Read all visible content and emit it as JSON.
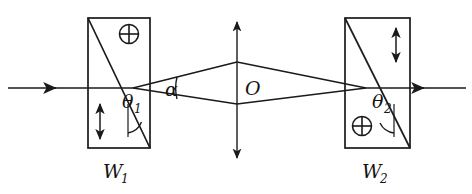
{
  "figure": {
    "background_color": "#ffffff",
    "ink_color": "#1a1a1a",
    "width": 472,
    "height": 194
  },
  "labels": {
    "wedge_left_name": "W",
    "wedge_left_index": "1",
    "wedge_right_name": "W",
    "wedge_right_index": "2",
    "theta_left_symbol": "θ",
    "theta_left_index": "1",
    "theta_right_symbol": "θ",
    "theta_right_index": "2",
    "alpha_symbol": "α",
    "center_point": "O"
  },
  "elements": {
    "wedge_left": {
      "name": "W1",
      "marker_top_right": "circled-plus",
      "marker_bottom_left": "vertical-double-arrow",
      "diagonal": "top-left-to-bottom-right",
      "angle_label": "θ1"
    },
    "wedge_right": {
      "name": "W2",
      "marker_top_right": "vertical-double-arrow",
      "marker_bottom_left": "circled-plus",
      "diagonal": "top-left-to-bottom-right",
      "angle_label": "θ2"
    },
    "center_axis": {
      "name": "O",
      "style": "vertical-double-headed-arrow"
    },
    "input_ray": {
      "direction": "rightward",
      "style": "horizontal-with-arrowhead"
    },
    "output_ray": {
      "direction": "rightward",
      "style": "horizontal-with-arrowhead"
    },
    "divergence_angle": {
      "label": "α",
      "between": "two-diverging-rays"
    }
  },
  "geometry": {
    "axis_y": 88,
    "wedge_left_x1": 88,
    "wedge_left_x2": 150,
    "wedge_right_x1": 345,
    "wedge_right_x2": 410,
    "wedge_top_y": 18,
    "wedge_bottom_y": 148,
    "center_x": 237,
    "split_point_left_x": 133,
    "split_point_right_x": 366,
    "upper_ray_peak_y": 62,
    "lower_ray_peak_y": 104
  }
}
